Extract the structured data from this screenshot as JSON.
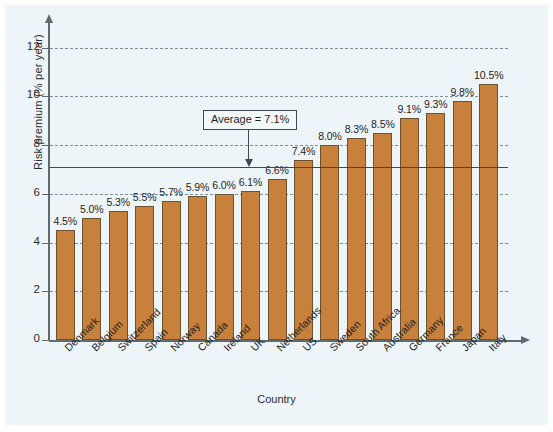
{
  "chart_data": {
    "type": "bar",
    "title": "",
    "xlabel": "Country",
    "ylabel": "Risk premium (% per year)",
    "ylim": [
      0,
      12.6
    ],
    "yticks": [
      0,
      2,
      4,
      6,
      8,
      10,
      12
    ],
    "ytick_labels": [
      "0",
      "2",
      "4",
      "6",
      "8",
      "10",
      "12"
    ],
    "gridlines": [
      2,
      4,
      6,
      8,
      10,
      12
    ],
    "grid": true,
    "legend": "none",
    "categories": [
      "Denmark",
      "Belgium",
      "Switzerland",
      "Spain",
      "Norway",
      "Canada",
      "Ireland",
      "UK",
      "Netherlands",
      "US",
      "Sweden",
      "South Africa",
      "Australia",
      "Germany",
      "France",
      "Japan",
      "Italy"
    ],
    "values": [
      4.5,
      5.0,
      5.3,
      5.5,
      5.7,
      5.9,
      6.0,
      6.1,
      6.6,
      7.4,
      8.0,
      8.3,
      8.5,
      9.1,
      9.3,
      9.8,
      10.5
    ],
    "value_labels": [
      "4.5%",
      "5.0%",
      "5.3%",
      "5.5%",
      "5.7%",
      "5.9%",
      "6.0%",
      "6.1%",
      "6.6%",
      "7.4%",
      "8.0%",
      "8.3%",
      "8.5%",
      "9.1%",
      "9.3%",
      "9.8%",
      "10.5%"
    ],
    "annotations": [
      {
        "name": "average-line",
        "label": "Average = 7.1%",
        "value": 7.1
      }
    ],
    "colors": {
      "bar_fill": "#c8813c",
      "bar_stroke": "#6b5330",
      "background": "#eef5f8",
      "axis": "#5d6b73",
      "gridline": "#7d8f99",
      "annotation": "#3c4a52"
    }
  }
}
